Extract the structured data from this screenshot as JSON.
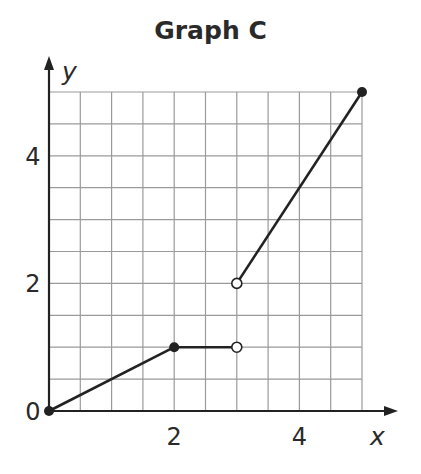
{
  "chart_data": {
    "type": "line",
    "title": "Graph C",
    "xlabel": "x",
    "ylabel": "y",
    "xlim": [
      0,
      5
    ],
    "ylim": [
      0,
      5
    ],
    "grid": true,
    "grid_step": 0.5,
    "x_ticks": [
      {
        "value": 0,
        "label": "0"
      },
      {
        "value": 2,
        "label": "2"
      },
      {
        "value": 4,
        "label": "4"
      }
    ],
    "y_ticks": [
      {
        "value": 2,
        "label": "2"
      },
      {
        "value": 4,
        "label": "4"
      }
    ],
    "segments": [
      {
        "from": [
          0,
          0
        ],
        "to": [
          2,
          1
        ],
        "start": "closed",
        "end": "closed"
      },
      {
        "from": [
          2,
          1
        ],
        "to": [
          3,
          1
        ],
        "start": "closed",
        "end": "open"
      },
      {
        "from": [
          3,
          2
        ],
        "to": [
          5,
          5
        ],
        "start": "open",
        "end": "closed"
      }
    ],
    "points": [
      {
        "x": 0,
        "y": 0,
        "style": "closed"
      },
      {
        "x": 2,
        "y": 1,
        "style": "closed"
      },
      {
        "x": 3,
        "y": 1,
        "style": "open"
      },
      {
        "x": 3,
        "y": 2,
        "style": "open"
      },
      {
        "x": 5,
        "y": 5,
        "style": "closed"
      }
    ],
    "colors": {
      "line": "#222222",
      "grid": "#9a9a9a",
      "axis": "#222222"
    }
  }
}
